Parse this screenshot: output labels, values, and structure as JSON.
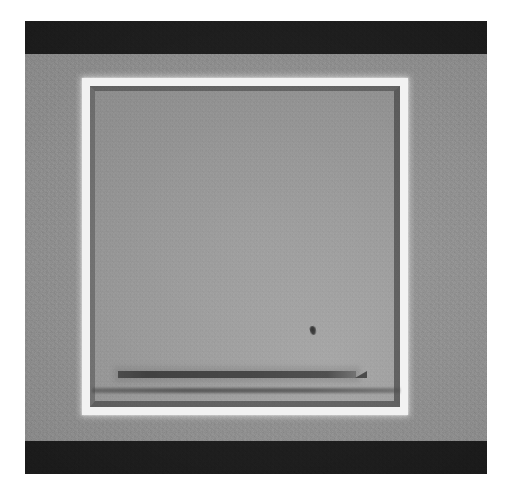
{
  "image": {
    "kind": "electron-micrograph",
    "width_px": 510,
    "height_px": 497,
    "page_background": "#ffffff",
    "caption": ""
  },
  "content_block": {
    "label": "",
    "x": 25,
    "y": 21,
    "width": 462,
    "height": 453,
    "background_color": "#8d8d8d"
  },
  "bars": [
    {
      "name": "top-dark-band",
      "color": "#1b1b1b",
      "y": 21,
      "height": 33
    },
    {
      "name": "bottom-dark-band",
      "color": "#1b1b1b",
      "y": 441,
      "height": 33
    }
  ],
  "field": {
    "name": "gray-substrate",
    "color": "#8f8f8f",
    "highlight_color": "#969696"
  },
  "window": {
    "name": "bright-bordered-square",
    "x": 82,
    "y": 78,
    "width": 326,
    "height": 337,
    "border_color": "#f2f2f2",
    "border_width_px": 8,
    "interior_color": "#999999",
    "lip_color": "#3a3a3a"
  },
  "features": [
    {
      "name": "long-dark-bar",
      "shape": "horizontal-tapered-line",
      "x": 118,
      "y": 371,
      "length": 238,
      "thickness": 7,
      "color": "#343434"
    },
    {
      "name": "lower-shadow-band",
      "shape": "horizontal-line",
      "x": 92,
      "y": 388,
      "length": 308,
      "thickness": 5,
      "color": "#444444"
    },
    {
      "name": "dark-particle",
      "shape": "speck",
      "x": 310,
      "y": 326,
      "width": 6,
      "height": 9,
      "color": "#2c2c2c"
    }
  ],
  "palette": {
    "white": "#ffffff",
    "bright_border": "#f2f2f2",
    "mid_gray": "#8f8f8f",
    "light_gray": "#a6a6a6",
    "dark_band": "#1b1b1b",
    "feature_dark": "#343434"
  }
}
